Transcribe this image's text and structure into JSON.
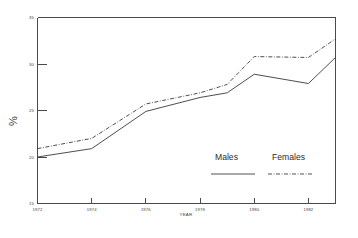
{
  "chart_data": {
    "type": "line",
    "title": "",
    "xlabel": "YEAR",
    "ylabel": "%",
    "xlim": [
      1972,
      1983
    ],
    "ylim": [
      15,
      35
    ],
    "grid": false,
    "legend_position": "inside-lower-right",
    "x_ticks": [
      "1972",
      "1974",
      "1976",
      "1978",
      "1980",
      "1982"
    ],
    "x_tick_values": [
      1972,
      1974,
      1976,
      1978,
      1980,
      1982
    ],
    "y_ticks": [
      "15",
      "20",
      "25",
      "30",
      "35"
    ],
    "y_tick_values": [
      15,
      20,
      25,
      30,
      35
    ],
    "x": [
      1972,
      1974,
      1976,
      1978,
      1979,
      1980,
      1982,
      1983
    ],
    "series": [
      {
        "name": "Males",
        "style": "solid",
        "color": "#3a3a3a",
        "values": [
          20.0,
          20.9,
          24.9,
          26.4,
          26.9,
          28.9,
          27.9,
          30.7
        ]
      },
      {
        "name": "Females",
        "style": "dashed",
        "color": "#3a3a3a",
        "values": [
          20.9,
          22.0,
          25.7,
          26.9,
          27.8,
          30.8,
          30.7,
          32.7
        ]
      }
    ]
  },
  "legend": {
    "males_label": "Males",
    "females_label": "Females"
  },
  "axes": {
    "y_title": "%",
    "x_title": "YEAR"
  }
}
